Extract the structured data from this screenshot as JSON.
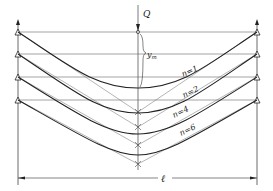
{
  "diagram": {
    "load_label": "Q",
    "deflection_label": "y",
    "deflection_subscript": "m",
    "span_label": "ℓ",
    "curves": [
      {
        "label": "n=1",
        "support_y": 32,
        "bottom_y": 88,
        "v_apex_y": 112
      },
      {
        "label": "n=2",
        "support_y": 54,
        "bottom_y": 113,
        "v_apex_y": 127
      },
      {
        "label": "n=4",
        "support_y": 77,
        "bottom_y": 134,
        "v_apex_y": 145
      },
      {
        "label": "n=6",
        "support_y": 100,
        "bottom_y": 155,
        "v_apex_y": 164
      }
    ],
    "colors": {
      "line": "#2a2a2a",
      "thin_line": "#555555",
      "background": "#ffffff"
    }
  }
}
